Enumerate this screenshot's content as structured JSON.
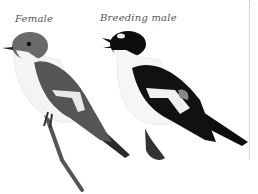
{
  "figure": {
    "labels": {
      "female": "Female",
      "breeding_male": "Breeding male"
    },
    "birds": [
      {
        "name": "female",
        "plumage": "grey-brown upperparts, white underparts, white wing patch"
      },
      {
        "name": "breeding-male",
        "plumage": "black upperparts, white underparts, white forehead and wing patch"
      }
    ],
    "colors": {
      "background": "#ffffff",
      "female_back": "#5a5a5a",
      "male_back": "#111111",
      "underparts": "#f4f4f4",
      "label": "#555555"
    }
  }
}
